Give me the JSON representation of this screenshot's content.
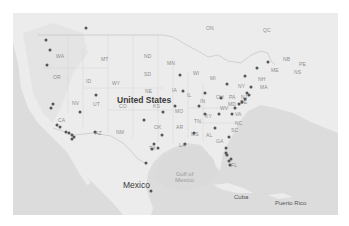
{
  "map": {
    "countries": [
      {
        "name": "United States",
        "x": 104,
        "y": 83
      },
      {
        "name": "Mexico",
        "x": 110,
        "y": 168
      },
      {
        "name": "Cuba",
        "x": 221,
        "y": 181
      },
      {
        "name": "Puerto Rico",
        "x": 262,
        "y": 187
      }
    ],
    "water_labels": [
      {
        "name": "Gulf of\nMexico",
        "line1": "Gulf of",
        "line2": "Mexico",
        "x": 162,
        "y": 158
      }
    ],
    "region_labels": [
      {
        "code": "WA",
        "x": 43,
        "y": 41
      },
      {
        "code": "OR",
        "x": 40,
        "y": 62
      },
      {
        "code": "ID",
        "x": 73,
        "y": 66
      },
      {
        "code": "MT",
        "x": 88,
        "y": 44
      },
      {
        "code": "WY",
        "x": 99,
        "y": 68
      },
      {
        "code": "NV",
        "x": 59,
        "y": 88
      },
      {
        "code": "UT",
        "x": 80,
        "y": 89
      },
      {
        "code": "CA",
        "x": 45,
        "y": 105
      },
      {
        "code": "AZ",
        "x": 82,
        "y": 118
      },
      {
        "code": "NM",
        "x": 103,
        "y": 117
      },
      {
        "code": "CO",
        "x": 106,
        "y": 91
      },
      {
        "code": "ND",
        "x": 131,
        "y": 41
      },
      {
        "code": "SD",
        "x": 131,
        "y": 59
      },
      {
        "code": "NE",
        "x": 132,
        "y": 76
      },
      {
        "code": "KS",
        "x": 140,
        "y": 91
      },
      {
        "code": "OK",
        "x": 141,
        "y": 112
      },
      {
        "code": "TX",
        "x": 136,
        "y": 133
      },
      {
        "code": "MN",
        "x": 154,
        "y": 48
      },
      {
        "code": "IA",
        "x": 159,
        "y": 75
      },
      {
        "code": "MO",
        "x": 162,
        "y": 96
      },
      {
        "code": "AR",
        "x": 163,
        "y": 112
      },
      {
        "code": "LA",
        "x": 166,
        "y": 130
      },
      {
        "code": "WI",
        "x": 180,
        "y": 58
      },
      {
        "code": "IL",
        "x": 174,
        "y": 80
      },
      {
        "code": "MI",
        "x": 197,
        "y": 63
      },
      {
        "code": "IN",
        "x": 187,
        "y": 86
      },
      {
        "code": "OH",
        "x": 203,
        "y": 82
      },
      {
        "code": "KY",
        "x": 192,
        "y": 101
      },
      {
        "code": "TN",
        "x": 181,
        "y": 106
      },
      {
        "code": "MS",
        "x": 178,
        "y": 119
      },
      {
        "code": "AL",
        "x": 193,
        "y": 120
      },
      {
        "code": "GA",
        "x": 203,
        "y": 126
      },
      {
        "code": "FL",
        "x": 218,
        "y": 150
      },
      {
        "code": "SC",
        "x": 218,
        "y": 115
      },
      {
        "code": "NC",
        "x": 222,
        "y": 108
      },
      {
        "code": "VA",
        "x": 222,
        "y": 99
      },
      {
        "code": "WV",
        "x": 207,
        "y": 93
      },
      {
        "code": "PA",
        "x": 216,
        "y": 82
      },
      {
        "code": "NY",
        "x": 225,
        "y": 71
      },
      {
        "code": "MD",
        "x": 215,
        "y": 89
      },
      {
        "code": "DE",
        "x": 227,
        "y": 87
      },
      {
        "code": "NJ",
        "x": 228,
        "y": 82
      },
      {
        "code": "NH",
        "x": 245,
        "y": 64
      },
      {
        "code": "MA",
        "x": 247,
        "y": 72
      },
      {
        "code": "ME",
        "x": 258,
        "y": 55
      },
      {
        "code": "NB",
        "x": 270,
        "y": 44
      },
      {
        "code": "PE",
        "x": 286,
        "y": 49
      },
      {
        "code": "NS",
        "x": 281,
        "y": 57
      },
      {
        "code": "ON",
        "x": 193,
        "y": 13
      },
      {
        "code": "QC",
        "x": 250,
        "y": 15
      }
    ],
    "markers": [
      {
        "x": 73,
        "y": 15
      },
      {
        "x": 33,
        "y": 27
      },
      {
        "x": 37,
        "y": 37
      },
      {
        "x": 34,
        "y": 52
      },
      {
        "x": 40,
        "y": 91
      },
      {
        "x": 38,
        "y": 95
      },
      {
        "x": 44,
        "y": 112
      },
      {
        "x": 53,
        "y": 119
      },
      {
        "x": 56,
        "y": 120
      },
      {
        "x": 59,
        "y": 122
      },
      {
        "x": 61,
        "y": 124
      },
      {
        "x": 59,
        "y": 126
      },
      {
        "x": 47,
        "y": 114
      },
      {
        "x": 83,
        "y": 82
      },
      {
        "x": 67,
        "y": 99
      },
      {
        "x": 82,
        "y": 119
      },
      {
        "x": 139,
        "y": 136
      },
      {
        "x": 141,
        "y": 131
      },
      {
        "x": 145,
        "y": 135
      },
      {
        "x": 149,
        "y": 122
      },
      {
        "x": 150,
        "y": 99
      },
      {
        "x": 131,
        "y": 107
      },
      {
        "x": 162,
        "y": 93
      },
      {
        "x": 170,
        "y": 78
      },
      {
        "x": 167,
        "y": 62
      },
      {
        "x": 172,
        "y": 131
      },
      {
        "x": 181,
        "y": 120
      },
      {
        "x": 186,
        "y": 93
      },
      {
        "x": 192,
        "y": 101
      },
      {
        "x": 192,
        "y": 80
      },
      {
        "x": 208,
        "y": 85
      },
      {
        "x": 214,
        "y": 71
      },
      {
        "x": 226,
        "y": 91
      },
      {
        "x": 229,
        "y": 89
      },
      {
        "x": 232,
        "y": 86
      },
      {
        "x": 234,
        "y": 80
      },
      {
        "x": 236,
        "y": 82
      },
      {
        "x": 238,
        "y": 74
      },
      {
        "x": 244,
        "y": 55
      },
      {
        "x": 255,
        "y": 49
      },
      {
        "x": 232,
        "y": 63
      },
      {
        "x": 206,
        "y": 101
      },
      {
        "x": 219,
        "y": 101
      },
      {
        "x": 222,
        "y": 95
      },
      {
        "x": 202,
        "y": 115
      },
      {
        "x": 216,
        "y": 124
      },
      {
        "x": 213,
        "y": 135
      },
      {
        "x": 213,
        "y": 140
      },
      {
        "x": 214,
        "y": 142
      },
      {
        "x": 218,
        "y": 146
      },
      {
        "x": 217,
        "y": 152
      },
      {
        "x": 216,
        "y": 148
      },
      {
        "x": 133,
        "y": 150
      },
      {
        "x": 138,
        "y": 178
      }
    ]
  }
}
